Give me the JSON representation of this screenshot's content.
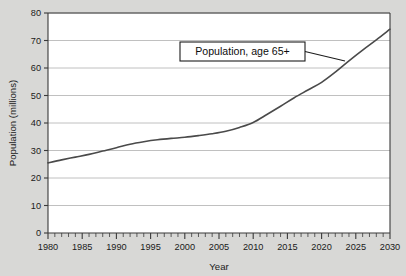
{
  "chart_data": {
    "type": "line",
    "title": "",
    "xlabel": "Year",
    "ylabel": "Population (millions)",
    "xlim": [
      1980,
      2030
    ],
    "ylim": [
      0,
      80
    ],
    "grid": "horizontal",
    "legend_position": "none",
    "x_tick_labels": [
      "1980",
      "1985",
      "1990",
      "1995",
      "2000",
      "2005",
      "2010",
      "2015",
      "2020",
      "2025",
      "2030"
    ],
    "x_ticks": [
      1980,
      1985,
      1990,
      1995,
      2000,
      2005,
      2010,
      2015,
      2020,
      2025,
      2030
    ],
    "x_minor_tick_interval": 1,
    "y_tick_labels": [
      "0",
      "10",
      "20",
      "30",
      "40",
      "50",
      "60",
      "70",
      "80"
    ],
    "y_ticks": [
      0,
      10,
      20,
      30,
      40,
      50,
      60,
      70,
      80
    ],
    "annotations": [
      {
        "text": "Population, age 65+",
        "box_x": 180,
        "box_y": 42,
        "box_w": 125,
        "box_h": 19,
        "leader_to_x": 345,
        "leader_to_y": 61
      }
    ],
    "series": [
      {
        "name": "Population, age 65+",
        "color": "#4a4a4a",
        "x": [
          1980,
          1982,
          1984,
          1986,
          1988,
          1990,
          1992,
          1994,
          1996,
          1998,
          2000,
          2002,
          2004,
          2006,
          2008,
          2010,
          2012,
          2014,
          2016,
          2018,
          2020,
          2022,
          2024,
          2026,
          2028,
          2030
        ],
        "values": [
          25.5,
          26.6,
          27.6,
          28.6,
          29.8,
          31.0,
          32.3,
          33.2,
          33.9,
          34.4,
          34.8,
          35.4,
          36.1,
          37.0,
          38.4,
          40.2,
          43.1,
          46.1,
          49.2,
          52.0,
          54.8,
          58.5,
          62.6,
          66.5,
          70.2,
          74.1
        ]
      }
    ]
  },
  "axes": {
    "y_title": "Population (millions)",
    "x_title": "Year"
  }
}
